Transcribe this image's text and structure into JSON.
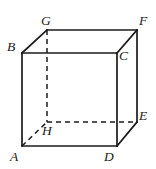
{
  "figure": {
    "name": "cube-diagram",
    "type": "geometric-solid",
    "shape": "cube",
    "background_color": "#ffffff",
    "stroke_color": "#1b1b1b",
    "canvas": {
      "width": 156,
      "height": 169
    },
    "vertices": [
      {
        "id": "A",
        "label": "A",
        "x": 22,
        "y": 146,
        "label_x": 10,
        "label_y": 150,
        "visible": true
      },
      {
        "id": "B",
        "label": "B",
        "x": 22,
        "y": 53,
        "label_x": 7,
        "label_y": 40,
        "visible": true
      },
      {
        "id": "C",
        "label": "C",
        "x": 117,
        "y": 53,
        "label_x": 119,
        "label_y": 49,
        "visible": true
      },
      {
        "id": "D",
        "label": "D",
        "x": 117,
        "y": 146,
        "label_x": 104,
        "label_y": 150,
        "visible": true
      },
      {
        "id": "E",
        "label": "E",
        "x": 137,
        "y": 122,
        "label_x": 139,
        "label_y": 109,
        "visible": true
      },
      {
        "id": "F",
        "label": "F",
        "x": 137,
        "y": 30,
        "label_x": 139,
        "label_y": 14,
        "visible": true
      },
      {
        "id": "G",
        "label": "G",
        "x": 47,
        "y": 30,
        "label_x": 41,
        "label_y": 14,
        "visible": true
      },
      {
        "id": "H",
        "label": "H",
        "x": 47,
        "y": 122,
        "label_x": 42,
        "label_y": 124,
        "visible": false
      }
    ],
    "edges_solid": [
      {
        "name": "edge-A-B",
        "from": "A",
        "to": "B"
      },
      {
        "name": "edge-B-C",
        "from": "B",
        "to": "C"
      },
      {
        "name": "edge-C-D",
        "from": "C",
        "to": "D"
      },
      {
        "name": "edge-D-A",
        "from": "D",
        "to": "A"
      },
      {
        "name": "edge-B-G",
        "from": "B",
        "to": "G"
      },
      {
        "name": "edge-G-F",
        "from": "G",
        "to": "F"
      },
      {
        "name": "edge-C-F",
        "from": "C",
        "to": "F"
      },
      {
        "name": "edge-F-E",
        "from": "F",
        "to": "E"
      },
      {
        "name": "edge-D-E",
        "from": "D",
        "to": "E"
      }
    ],
    "edges_hidden": [
      {
        "name": "edge-G-H",
        "from": "G",
        "to": "H"
      },
      {
        "name": "edge-H-E",
        "from": "H",
        "to": "E"
      },
      {
        "name": "edge-A-H",
        "from": "A",
        "to": "H"
      }
    ]
  }
}
